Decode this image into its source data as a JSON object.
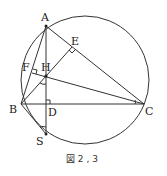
{
  "figure": {
    "caption": "図 2 , 3",
    "points": {
      "A": "A",
      "B": "B",
      "C": "C",
      "D": "D",
      "E": "E",
      "F": "F",
      "H": "H",
      "S": "S"
    },
    "colors": {
      "stroke": "#333333",
      "background": "#ffffff"
    }
  }
}
